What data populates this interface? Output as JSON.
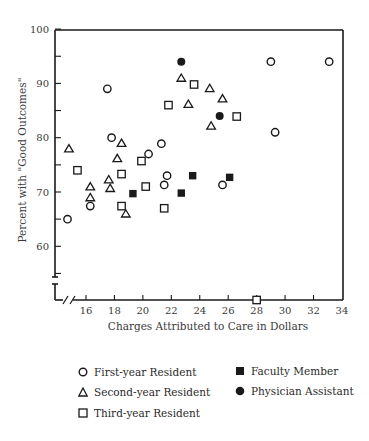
{
  "chart_data": {
    "type": "scatter",
    "title": "",
    "xlabel": "Charges Attributed to Care in Dollars",
    "ylabel": "Percent with \"Good Outcomes\"",
    "xlim": [
      14.5,
      34
    ],
    "ylim": [
      50,
      100
    ],
    "x_ticks": [
      16,
      18,
      20,
      22,
      24,
      26,
      28,
      30,
      32,
      34
    ],
    "y_ticks": [
      60,
      70,
      80,
      90,
      100
    ],
    "axis_breaks": [
      "x-axis break near origin",
      "y-axis break below 60"
    ],
    "grid": false,
    "legend_position": "below",
    "series": [
      {
        "name": "First-year Resident",
        "marker": "open-circle",
        "points": [
          [
            14.7,
            65
          ],
          [
            16.3,
            67.4
          ],
          [
            17.5,
            89
          ],
          [
            17.8,
            80
          ],
          [
            20.4,
            77
          ],
          [
            21.3,
            78.9
          ],
          [
            21.7,
            73
          ],
          [
            21.5,
            71.3
          ],
          [
            25.6,
            71.3
          ],
          [
            29,
            94
          ],
          [
            29.3,
            81
          ],
          [
            33.1,
            94
          ]
        ]
      },
      {
        "name": "Second-year Resident",
        "marker": "open-triangle",
        "points": [
          [
            14.8,
            78
          ],
          [
            16.3,
            71
          ],
          [
            16.3,
            69
          ],
          [
            17.6,
            72.3
          ],
          [
            17.7,
            70.7
          ],
          [
            18.2,
            76.2
          ],
          [
            18.5,
            79
          ],
          [
            18.8,
            66
          ],
          [
            22.7,
            91
          ],
          [
            23.2,
            86.2
          ],
          [
            24.7,
            89.1
          ],
          [
            25.6,
            87.2
          ],
          [
            24.8,
            82.2
          ]
        ]
      },
      {
        "name": "Third-year Resident",
        "marker": "open-square",
        "points": [
          [
            15.4,
            74
          ],
          [
            18.5,
            73.3
          ],
          [
            18.5,
            67.4
          ],
          [
            19.9,
            75.7
          ],
          [
            20.2,
            71
          ],
          [
            21.5,
            67
          ],
          [
            21.8,
            86
          ],
          [
            23.6,
            89.8
          ],
          [
            26.6,
            83.9
          ],
          [
            28,
            50
          ]
        ]
      },
      {
        "name": "Faculty Member",
        "marker": "filled-square",
        "points": [
          [
            19.3,
            69.7
          ],
          [
            22.7,
            69.8
          ],
          [
            23.5,
            73
          ],
          [
            26.1,
            72.7
          ]
        ]
      },
      {
        "name": "Physician Assistant",
        "marker": "filled-circle",
        "points": [
          [
            22.7,
            94
          ],
          [
            25.4,
            84
          ]
        ]
      }
    ]
  },
  "legend": {
    "items": [
      {
        "label": "First-year Resident",
        "marker": "open-circle"
      },
      {
        "label": "Second-year Resident",
        "marker": "open-triangle"
      },
      {
        "label": "Third-year Resident",
        "marker": "open-square"
      },
      {
        "label": "Faculty Member",
        "marker": "filled-square"
      },
      {
        "label": "Physician Assistant",
        "marker": "filled-circle"
      }
    ]
  },
  "colors": {
    "ink": "#1a1a1a",
    "text": "#3a3a3a",
    "background": "#ffffff"
  }
}
